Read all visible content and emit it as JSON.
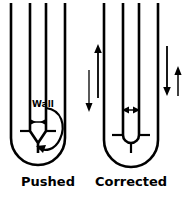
{
  "figure": {
    "background_color": "#ffffff",
    "ink_color": "#000000",
    "width": 191,
    "height": 198
  },
  "panels": [
    {
      "id": "pushed",
      "caption": "Pushed",
      "caption_x": 48,
      "caption_y": 186,
      "wall_label": "Wall",
      "wall_label_x": 32,
      "wall_label_y": 107,
      "inner_gap_arrow": {
        "name": "inward-double-arrow",
        "direction": "inward",
        "glyph": "> <"
      },
      "recirculation_arrow": {
        "name": "curved-recirculation-arrow",
        "direction": "clockwise-loop"
      },
      "description": "Outer U-tube with inner tube pinched to a narrow V at the base"
    },
    {
      "id": "corrected",
      "caption": "Corrected",
      "caption_x": 118,
      "caption_y": 186,
      "inner_gap_arrow": {
        "name": "outward-double-arrow",
        "direction": "outward",
        "glyph": "< >"
      },
      "flow_arrows": [
        {
          "name": "flow-arrow-up-left",
          "direction": "up"
        },
        {
          "name": "flow-arrow-down-left",
          "direction": "down"
        },
        {
          "name": "flow-arrow-down-right",
          "direction": "down"
        },
        {
          "name": "flow-arrow-up-right",
          "direction": "up"
        }
      ],
      "description": "Outer U-tube with inner tube forming a clean rounded U and a short stem"
    }
  ]
}
